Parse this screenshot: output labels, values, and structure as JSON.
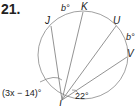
{
  "problem": {
    "number": "21."
  },
  "diagram": {
    "points": {
      "J": "J",
      "K": "K",
      "U": "U",
      "V": "V",
      "vertex": "L"
    },
    "arcs": {
      "JK": "b°",
      "UV": "b°"
    },
    "angles": {
      "left": "(3x − 14)°",
      "right": "22°"
    }
  }
}
